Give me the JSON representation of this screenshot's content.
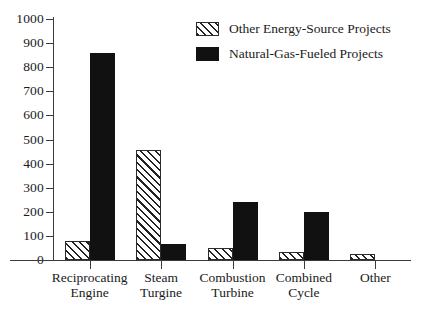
{
  "chart_data": {
    "type": "bar",
    "title": "",
    "subtitle": "",
    "xlabel": "",
    "ylabel": "",
    "ylim": [
      0,
      1000
    ],
    "grid": false,
    "legend_position": "top-right",
    "categories": [
      "Reciprocating Engine",
      "Steam Turgine",
      "Combustion Turbine",
      "Combined Cycle",
      "Other"
    ],
    "category_lines": [
      [
        "Reciprocating",
        "Engine"
      ],
      [
        "Steam",
        "Turgine"
      ],
      [
        "Combustion",
        "Turbine"
      ],
      [
        "Combined",
        "Cycle"
      ],
      [
        "Other",
        ""
      ]
    ],
    "ytick_labels": [
      "1000",
      "900",
      "800",
      "700",
      "600",
      "500",
      "400",
      "300",
      "200",
      "100",
      "0"
    ],
    "ytick_values": [
      1000,
      900,
      800,
      700,
      600,
      500,
      400,
      300,
      200,
      100,
      0
    ],
    "series": [
      {
        "name": "Other Energy-Source Projects",
        "fill": "hatched",
        "color": "#ffffff",
        "hatch_color": "#222222",
        "values": [
          80,
          455,
          50,
          33,
          25
        ]
      },
      {
        "name": "Natural-Gas-Fueled Projects",
        "fill": "solid",
        "color": "#111111",
        "values": [
          860,
          65,
          240,
          200,
          0
        ]
      }
    ]
  },
  "legend": {
    "items": [
      {
        "label": "Other Energy-Source Projects",
        "fill": "hatched"
      },
      {
        "label": "Natural-Gas-Fueled Projects",
        "fill": "solid"
      }
    ]
  },
  "axes": {
    "y_max_label": "1000",
    "y_min_label": "0"
  }
}
